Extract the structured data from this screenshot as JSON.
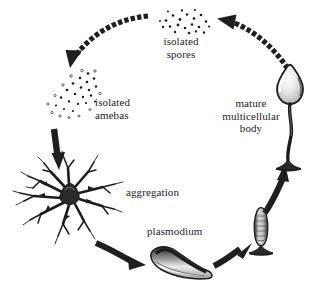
{
  "figure": {
    "background_color": "#ffffff",
    "ink_color": "#1c1c1c"
  },
  "labels": {
    "isolated_spores_line1": "isolated",
    "isolated_spores_line2": "spores",
    "isolated_amebas_line1": "isolated",
    "isolated_amebas_line2": "amebas",
    "mature_body_line1": "mature",
    "mature_body_line2": "multicellular",
    "mature_body_line3": "body",
    "aggregation": "aggregation",
    "plasmodium": "plasmodium"
  },
  "stages": [
    {
      "id": "isolated-spores",
      "label": "isolated spores",
      "depiction": "scattered-dot-cluster"
    },
    {
      "id": "isolated-amebas",
      "label": "isolated amebas",
      "depiction": "scattered-dot-cluster"
    },
    {
      "id": "aggregation",
      "label": "aggregation",
      "depiction": "radiating-branched-star"
    },
    {
      "id": "plasmodium",
      "label": "plasmodium",
      "depiction": "slug-shaped-mass"
    },
    {
      "id": "culmination",
      "label": "",
      "depiction": "upright-stalked-column"
    },
    {
      "id": "mature-multicellular-body",
      "label": "mature multicellular body",
      "depiction": "stalked-sporangium"
    }
  ],
  "arrows": [
    {
      "id": "spores-to-amebas",
      "style": "dashed",
      "direction": "top-right-to-left-down"
    },
    {
      "id": "amebas-to-aggregation",
      "style": "solid",
      "direction": "down"
    },
    {
      "id": "aggregation-to-plasmodium",
      "style": "solid",
      "direction": "down-right"
    },
    {
      "id": "plasmodium-to-culmination",
      "style": "solid",
      "direction": "up-right"
    },
    {
      "id": "culmination-to-mature-body",
      "style": "solid",
      "direction": "up"
    },
    {
      "id": "mature-body-to-spores",
      "style": "dashed",
      "direction": "up-left"
    }
  ]
}
